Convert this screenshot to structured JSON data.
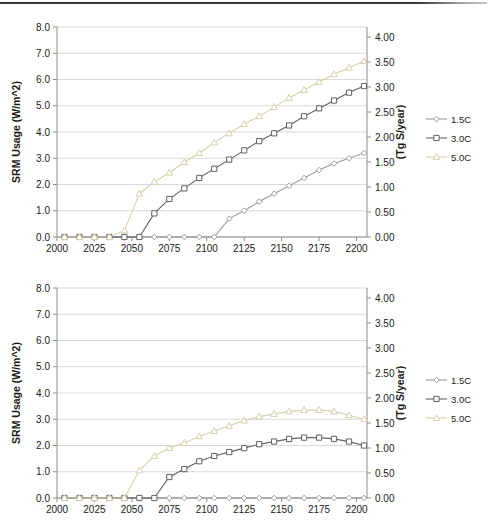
{
  "page": {
    "top_rule_color": "#3b3b3b"
  },
  "colors": {
    "grid": "#d9d9d9",
    "axis": "#8c8c8c",
    "tick_text": "#1a1a1a",
    "series_1_5C": "#9c9c9c",
    "series_3_0C": "#616161",
    "series_5_0C": "#d6d0ac"
  },
  "legend": {
    "items": [
      {
        "label": "1.5C",
        "marker": "diamond",
        "color": "#9c9c9c"
      },
      {
        "label": "3.0C",
        "marker": "square",
        "color": "#616161"
      },
      {
        "label": "5.0C",
        "marker": "triangle",
        "color": "#d6d0ac"
      }
    ]
  },
  "chart_data": [
    {
      "type": "line",
      "title": "",
      "xlabel": "",
      "ylabel_left": "SRM Usage (W/m^2)",
      "ylabel_right": "(Tg S/year)",
      "x_ticks": [
        2000,
        2025,
        2050,
        2075,
        2100,
        2125,
        2150,
        2175,
        2200
      ],
      "x_range": [
        2000,
        2207
      ],
      "y_left": {
        "min": 0,
        "max": 8,
        "step": 1,
        "decimals": 1,
        "range_top": 8
      },
      "y_right": {
        "min": 0,
        "max": 4,
        "step": 0.5,
        "decimals": 2,
        "range_top": 4.2
      },
      "grid": true,
      "legend_position": "right",
      "x": [
        2005,
        2015,
        2025,
        2035,
        2045,
        2055,
        2065,
        2075,
        2085,
        2095,
        2105,
        2115,
        2125,
        2135,
        2145,
        2155,
        2165,
        2175,
        2185,
        2195,
        2205
      ],
      "series": [
        {
          "name": "1.5C",
          "marker": "diamond",
          "color": "#9c9c9c",
          "values": [
            0,
            0,
            0,
            0,
            0,
            0,
            0,
            0,
            0,
            0,
            0,
            0.7,
            1.0,
            1.35,
            1.65,
            1.95,
            2.25,
            2.55,
            2.8,
            3.0,
            3.2
          ]
        },
        {
          "name": "3.0C",
          "marker": "square",
          "color": "#616161",
          "values": [
            0,
            0,
            0,
            0,
            0,
            0,
            0.9,
            1.45,
            1.85,
            2.25,
            2.6,
            2.95,
            3.3,
            3.65,
            3.95,
            4.25,
            4.6,
            4.9,
            5.2,
            5.5,
            5.75
          ]
        },
        {
          "name": "5.0C",
          "marker": "triangle",
          "color": "#d6d0ac",
          "values": [
            0,
            0,
            0,
            0,
            0.25,
            1.65,
            2.1,
            2.45,
            2.85,
            3.2,
            3.6,
            3.95,
            4.3,
            4.6,
            4.95,
            5.3,
            5.6,
            5.9,
            6.2,
            6.45,
            6.7
          ]
        }
      ]
    },
    {
      "type": "line",
      "title": "",
      "xlabel": "",
      "ylabel_left": "SRM Usage (W/m^2)",
      "ylabel_right": "(Tg S/year)",
      "x_ticks": [
        2000,
        2025,
        2050,
        2075,
        2100,
        2125,
        2150,
        2175,
        2200
      ],
      "x_range": [
        2000,
        2207
      ],
      "y_left": {
        "min": 0,
        "max": 8,
        "step": 1,
        "decimals": 1,
        "range_top": 8
      },
      "y_right": {
        "min": 0,
        "max": 4,
        "step": 0.5,
        "decimals": 2,
        "range_top": 4.2
      },
      "grid": true,
      "legend_position": "right",
      "x": [
        2005,
        2015,
        2025,
        2035,
        2045,
        2055,
        2065,
        2075,
        2085,
        2095,
        2105,
        2115,
        2125,
        2135,
        2145,
        2155,
        2165,
        2175,
        2185,
        2195,
        2205
      ],
      "series": [
        {
          "name": "1.5C",
          "marker": "diamond",
          "color": "#9c9c9c",
          "values": [
            0,
            0,
            0,
            0,
            0,
            0,
            0,
            0,
            0,
            0,
            0,
            0,
            0,
            0,
            0,
            0,
            0,
            0,
            0,
            0,
            0
          ]
        },
        {
          "name": "3.0C",
          "marker": "square",
          "color": "#616161",
          "values": [
            0,
            0,
            0,
            0,
            0,
            0,
            0,
            0.8,
            1.1,
            1.4,
            1.6,
            1.75,
            1.9,
            2.05,
            2.15,
            2.25,
            2.3,
            2.3,
            2.25,
            2.15,
            2.0
          ]
        },
        {
          "name": "5.0C",
          "marker": "triangle",
          "color": "#d6d0ac",
          "values": [
            0,
            0,
            0,
            0,
            0,
            1.05,
            1.6,
            1.9,
            2.1,
            2.35,
            2.55,
            2.75,
            2.95,
            3.1,
            3.2,
            3.3,
            3.35,
            3.35,
            3.3,
            3.15,
            3.0
          ]
        }
      ]
    }
  ]
}
